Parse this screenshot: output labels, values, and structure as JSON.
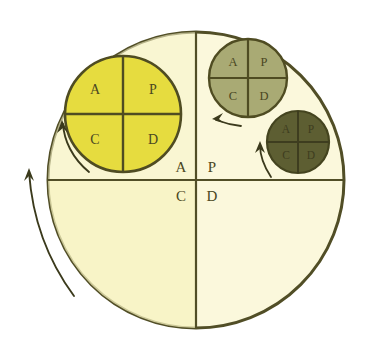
{
  "diagram": {
    "colors": {
      "page_background": "#ffffff",
      "outline": "#514e26",
      "main_circle_fill": "#fbf8dc",
      "main_circle_fill_lower_left": "#f7f3c0",
      "large_circle_fill": "#e6dc3f",
      "medium_circle_fill": "#a9aa74",
      "dark_circle_fill": "#5d5e32",
      "label_dark": "#4a4722",
      "label_faint": "#3e3d1f",
      "arrow": "#3b3a1c"
    },
    "main_cycle": {
      "name": "outer-pdca-cycle",
      "center_x": 196,
      "center_y": 180,
      "radius": 148,
      "quadrant_labels": {
        "top_left": "A",
        "top_right": "P",
        "bottom_left": "C",
        "bottom_right": "D"
      },
      "label_positions": {
        "top_left": {
          "x": 181,
          "y": 169
        },
        "top_right": {
          "x": 212,
          "y": 169
        },
        "bottom_left": {
          "x": 181,
          "y": 198
        },
        "bottom_right": {
          "x": 212,
          "y": 198
        }
      },
      "label_font_size": 15
    },
    "sub_cycles": [
      {
        "name": "large-yellow-pdca-cycle",
        "fill_key": "large_circle_fill",
        "center_x": 123,
        "center_y": 114,
        "radius": 58,
        "label_font_size": 14,
        "label_color_key": "label_dark",
        "quadrant_labels": {
          "top_left": "A",
          "top_right": "P",
          "bottom_left": "C",
          "bottom_right": "D"
        }
      },
      {
        "name": "medium-olive-pdca-cycle",
        "fill_key": "medium_circle_fill",
        "center_x": 248,
        "center_y": 78,
        "radius": 39,
        "label_font_size": 12,
        "label_color_key": "label_dark",
        "quadrant_labels": {
          "top_left": "A",
          "top_right": "P",
          "bottom_left": "C",
          "bottom_right": "D"
        }
      },
      {
        "name": "dark-olive-pdca-cycle",
        "fill_key": "dark_circle_fill",
        "center_x": 298,
        "center_y": 142,
        "radius": 31,
        "label_font_size": 11,
        "label_color_key": "label_faint",
        "quadrant_labels": {
          "top_left": "A",
          "top_right": "P",
          "bottom_left": "C",
          "bottom_right": "D"
        }
      }
    ],
    "arrows": [
      {
        "name": "outer-rotation-arrow",
        "description": "large counterclockwise arrow at far left of outer circle, pointing up"
      },
      {
        "name": "large-cycle-rotation-arrow",
        "description": "counterclockwise arrow along left edge of large yellow circle, pointing up"
      },
      {
        "name": "medium-cycle-rotation-arrow",
        "description": "short arrow below medium olive circle, pointing left"
      },
      {
        "name": "dark-cycle-rotation-arrow",
        "description": "curved arrow left of dark olive circle, pointing up"
      }
    ]
  }
}
